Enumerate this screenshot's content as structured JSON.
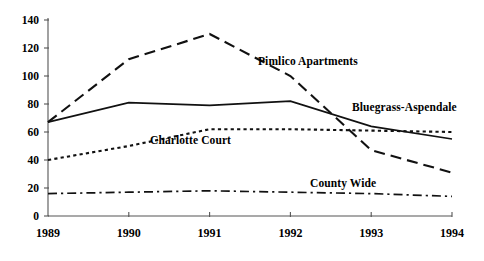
{
  "chart_data": {
    "type": "line",
    "title": "",
    "subtitle": "",
    "xlabel": "",
    "ylabel": "",
    "categories": [
      "1989",
      "1990",
      "1991",
      "1992",
      "1993",
      "1994"
    ],
    "x": [
      1989,
      1990,
      1991,
      1992,
      1993,
      1994
    ],
    "xlim": [
      1989,
      1994
    ],
    "ylim": [
      0,
      140
    ],
    "yticks": [
      0,
      20,
      40,
      60,
      80,
      100,
      120,
      140
    ],
    "ytick_labels": [
      "0",
      "20",
      "40",
      "60",
      "80",
      "100",
      "120",
      "140"
    ],
    "grid": false,
    "legend": "inline-annotations",
    "series": [
      {
        "name": "Pimlico Apartments",
        "style": "dashed",
        "color": "#111111",
        "values": [
          67,
          112,
          130,
          100,
          47,
          31
        ]
      },
      {
        "name": "Bluegrass-Aspendale",
        "style": "solid",
        "color": "#111111",
        "values": [
          67,
          81,
          79,
          82,
          64,
          55
        ]
      },
      {
        "name": "Charlotte Court",
        "style": "dotted",
        "color": "#111111",
        "values": [
          40,
          50,
          62,
          62,
          61,
          60
        ]
      },
      {
        "name": "County Wide",
        "style": "dash-dot",
        "color": "#111111",
        "values": [
          16,
          17,
          18,
          17,
          16,
          14
        ]
      }
    ],
    "annotations": [
      {
        "text": "Pimlico Apartments",
        "x_px": 258,
        "y_px": 55
      },
      {
        "text": "Bluegrass-Aspendale",
        "x_px": 352,
        "y_px": 101
      },
      {
        "text": "Charlotte Court",
        "x_px": 150,
        "y_px": 134
      },
      {
        "text": "County Wide",
        "x_px": 310,
        "y_px": 177
      }
    ]
  },
  "axes": {
    "y_tick_labels": [
      "140",
      "120",
      "100",
      "80",
      "60",
      "40",
      "20",
      "0"
    ],
    "x_tick_labels": [
      "1989",
      "1990",
      "1991",
      "1992",
      "1993",
      "1994"
    ]
  }
}
